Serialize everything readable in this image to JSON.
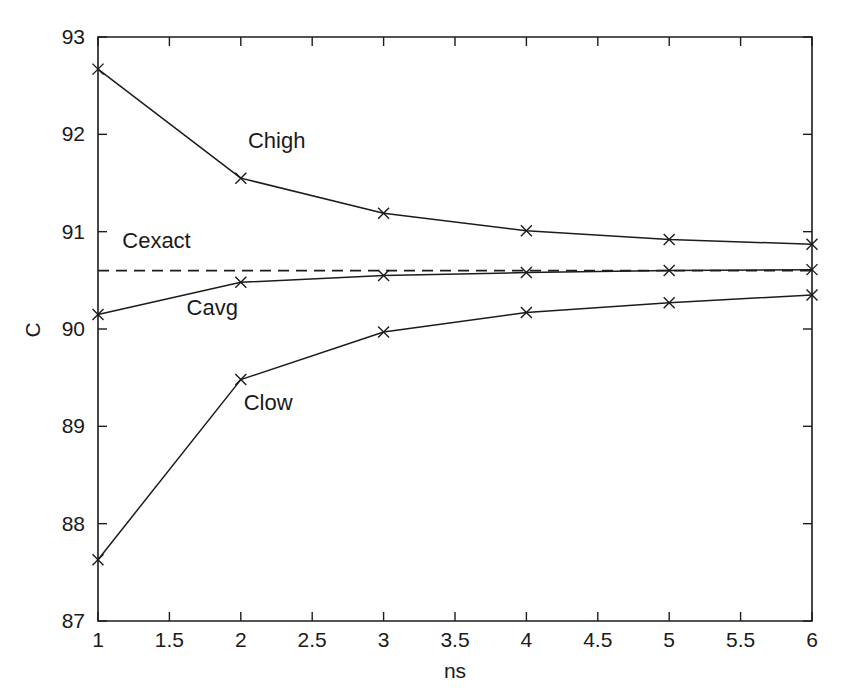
{
  "chart_data": {
    "type": "line",
    "title": "",
    "xlabel": "ns",
    "ylabel": "C",
    "xlim": [
      1,
      6
    ],
    "ylim": [
      87,
      93
    ],
    "grid": false,
    "legend_position": "inline-annotations",
    "x": [
      1,
      2,
      3,
      4,
      5,
      6
    ],
    "xticks": [
      1,
      1.5,
      2,
      2.5,
      3,
      3.5,
      4,
      4.5,
      5,
      5.5,
      6
    ],
    "xticklabels": [
      "1",
      "1.5",
      "2",
      "2.5",
      "3",
      "3.5",
      "4",
      "4.5",
      "5",
      "5.5",
      "6"
    ],
    "yticks": [
      87,
      88,
      89,
      90,
      91,
      92,
      93
    ],
    "yticklabels": [
      "87",
      "88",
      "89",
      "90",
      "91",
      "92",
      "93"
    ],
    "series": [
      {
        "name": "Chigh",
        "style": "solid",
        "marker": "x",
        "color": "#1c1c1c",
        "x": [
          1,
          2,
          3,
          4,
          5,
          6
        ],
        "values": [
          92.67,
          91.55,
          91.19,
          91.01,
          90.92,
          90.87
        ],
        "label": "Chigh",
        "label_x": 2.05,
        "label_y": 91.86
      },
      {
        "name": "Cavg",
        "style": "solid",
        "marker": "x",
        "color": "#1c1c1c",
        "x": [
          1,
          2,
          3,
          4,
          5,
          6
        ],
        "values": [
          90.15,
          90.48,
          90.55,
          90.58,
          90.6,
          90.61
        ],
        "label": "Cavg",
        "label_x": 1.62,
        "label_y": 90.14
      },
      {
        "name": "Clow",
        "style": "solid",
        "marker": "x",
        "color": "#1c1c1c",
        "x": [
          1,
          2,
          3,
          4,
          5,
          6
        ],
        "values": [
          87.63,
          89.48,
          89.97,
          90.17,
          90.27,
          90.35
        ],
        "label": "Clow",
        "label_x": 2.02,
        "label_y": 89.17
      },
      {
        "name": "Cexact",
        "style": "dashed",
        "marker": "none",
        "color": "#1c1c1c",
        "x": [
          1,
          6
        ],
        "values": [
          90.6,
          90.6
        ],
        "label": "Cexact",
        "label_x": 1.17,
        "label_y": 90.83
      }
    ]
  },
  "figure": {
    "background_color": "#ffffff",
    "axis_color": "#1c1c1c"
  }
}
